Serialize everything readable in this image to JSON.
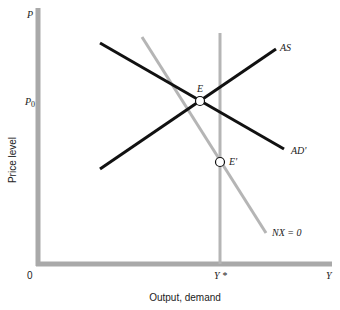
{
  "diagram": {
    "y_axis": {
      "symbol": "P",
      "title": "Price level",
      "tick_label_main": "P",
      "tick_label_sub": "0"
    },
    "x_axis": {
      "symbol": "Y",
      "title": "Output, demand",
      "origin": "0",
      "tick_label": "Y *"
    },
    "curves": [
      {
        "id": "AD",
        "label": "AD'",
        "color": "#111111"
      },
      {
        "id": "AS",
        "label": "AS",
        "color": "#111111"
      },
      {
        "id": "NX",
        "label": "NX = 0",
        "color": "#b5b5b5"
      },
      {
        "id": "Ystar",
        "label": "Y *",
        "color": "#b5b5b5"
      }
    ],
    "points": [
      {
        "id": "E",
        "label": "E"
      },
      {
        "id": "E_prime",
        "label": "E'"
      }
    ],
    "colors": {
      "axis": "#a9a9a9",
      "dark_line": "#111111",
      "gray_line": "#b5b5b5"
    }
  }
}
